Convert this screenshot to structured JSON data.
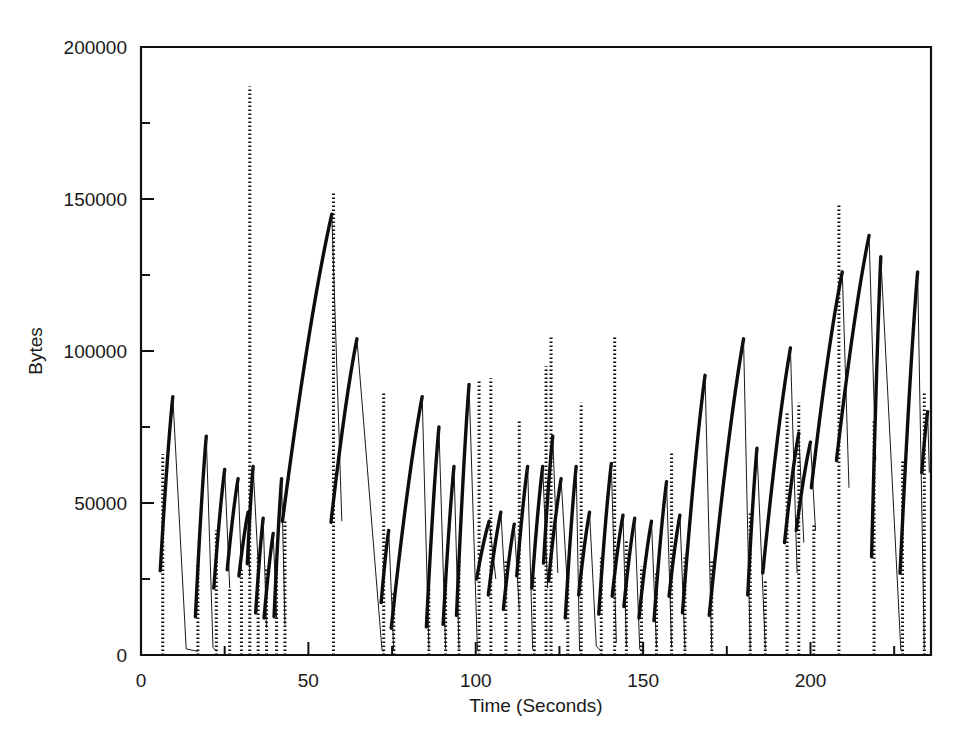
{
  "chart_data": {
    "type": "line",
    "title": "",
    "xlabel": "Time (Seconds)",
    "ylabel": "Bytes",
    "xlim": [
      0,
      236
    ],
    "ylim": [
      0,
      200000
    ],
    "grid": false,
    "legend": null,
    "xticks": [
      0,
      50,
      100,
      150,
      200
    ],
    "xtick_labels": [
      "0",
      "50",
      "100",
      "150",
      "200"
    ],
    "xticks_minor": [
      25,
      75,
      125,
      175,
      225
    ],
    "yticks": [
      0,
      50000,
      100000,
      150000,
      200000
    ],
    "ytick_labels": [
      "0",
      "50000",
      "100000",
      "150000",
      "200000"
    ],
    "yticks_minor": [
      25000,
      75000,
      125000,
      175000
    ],
    "series": [
      {
        "name": "Bytes in flight",
        "style": "sawtooth",
        "comment": "Each cycle: a dotted near-vertical rise from ~0 to a knee value, a solid sloped ramp up to a peak, then a steep thin drop back toward 0.",
        "cycles": [
          {
            "t_rise": 6.5,
            "y_knee": 66000,
            "t_peak": 9.5,
            "y_peak": 85000,
            "t_drop_end": 13.5,
            "y_drop": 2000
          },
          {
            "t_rise": 17.0,
            "y_knee": 30000,
            "t_peak": 19.5,
            "y_peak": 72000,
            "t_drop_end": 21.5,
            "y_drop": 2500
          },
          {
            "t_rise": 22.5,
            "y_knee": 41000,
            "t_peak": 25.0,
            "y_peak": 61000,
            "t_drop_end": 26.5,
            "y_drop": 22000
          },
          {
            "t_rise": 26.5,
            "y_knee": 22000,
            "t_peak": 29.0,
            "y_peak": 58000,
            "t_drop_end": 30.0,
            "y_drop": 28000
          },
          {
            "t_rise": 30.0,
            "y_knee": 28000,
            "t_peak": 32.0,
            "y_peak": 47000,
            "t_drop_end": 32.5,
            "y_drop": 26000
          },
          {
            "t_rise": 32.5,
            "y_knee": 187000,
            "t_peak": 33.5,
            "y_peak": 62000,
            "t_drop_end": 35.0,
            "y_drop": 30000
          },
          {
            "t_rise": 35.0,
            "y_knee": 33000,
            "t_peak": 36.5,
            "y_peak": 45000,
            "t_drop_end": 37.5,
            "y_drop": 9000
          },
          {
            "t_rise": 37.5,
            "y_knee": 29000,
            "t_peak": 39.5,
            "y_peak": 40000,
            "t_drop_end": 40.5,
            "y_drop": 12000
          },
          {
            "t_rise": 40.5,
            "y_knee": 30000,
            "t_peak": 42.0,
            "y_peak": 58000,
            "t_drop_end": 43.0,
            "y_drop": 10000
          },
          {
            "t_rise": 43.0,
            "y_knee": 44000,
            "t_peak": 57.0,
            "y_peak": 145000,
            "t_drop_end": 60.0,
            "y_drop": 44000
          },
          {
            "t_rise": 57.5,
            "y_knee": 152000,
            "t_peak": 64.5,
            "y_peak": 104000,
            "t_drop_end": 72.0,
            "y_drop": 1500
          },
          {
            "t_rise": 72.5,
            "y_knee": 86000,
            "t_peak": 74.0,
            "y_peak": 41000,
            "t_drop_end": 75.5,
            "y_drop": 1500
          },
          {
            "t_rise": 75.5,
            "y_knee": 21000,
            "t_peak": 84.0,
            "y_peak": 85000,
            "t_drop_end": 86.0,
            "y_drop": 2000
          },
          {
            "t_rise": 86.0,
            "y_knee": 22000,
            "t_peak": 89.0,
            "y_peak": 75000,
            "t_drop_end": 91.0,
            "y_drop": 2000
          },
          {
            "t_rise": 91.0,
            "y_knee": 24000,
            "t_peak": 93.5,
            "y_peak": 62000,
            "t_drop_end": 95.0,
            "y_drop": 2000
          },
          {
            "t_rise": 95.0,
            "y_knee": 31000,
            "t_peak": 98.0,
            "y_peak": 89000,
            "t_drop_end": 100.5,
            "y_drop": 1500
          },
          {
            "t_rise": 101.0,
            "y_knee": 90000,
            "t_peak": 104.0,
            "y_peak": 44000,
            "t_drop_end": 106.0,
            "y_drop": 25000
          },
          {
            "t_rise": 104.5,
            "y_knee": 91000,
            "t_peak": 107.5,
            "y_peak": 47000,
            "t_drop_end": 109.0,
            "y_drop": 18000
          },
          {
            "t_rise": 109.0,
            "y_knee": 31000,
            "t_peak": 111.5,
            "y_peak": 43000,
            "t_drop_end": 113.0,
            "y_drop": 15000
          },
          {
            "t_rise": 113.0,
            "y_knee": 77000,
            "t_peak": 115.5,
            "y_peak": 62000,
            "t_drop_end": 117.0,
            "y_drop": 2000
          },
          {
            "t_rise": 117.5,
            "y_knee": 26000,
            "t_peak": 120.0,
            "y_peak": 62000,
            "t_drop_end": 121.5,
            "y_drop": 22000
          },
          {
            "t_rise": 121.0,
            "y_knee": 95000,
            "t_peak": 123.0,
            "y_peak": 72000,
            "t_drop_end": 124.5,
            "y_drop": 27000
          },
          {
            "t_rise": 122.5,
            "y_knee": 105000,
            "t_peak": 125.5,
            "y_peak": 58000,
            "t_drop_end": 127.5,
            "y_drop": 20000
          },
          {
            "t_rise": 127.5,
            "y_knee": 29000,
            "t_peak": 130.0,
            "y_peak": 62000,
            "t_drop_end": 131.0,
            "y_drop": 1500
          },
          {
            "t_rise": 131.5,
            "y_knee": 83000,
            "t_peak": 134.0,
            "y_peak": 47000,
            "t_drop_end": 136.0,
            "y_drop": 3000
          },
          {
            "t_rise": 137.5,
            "y_knee": 32000,
            "t_peak": 140.5,
            "y_peak": 63000,
            "t_drop_end": 142.0,
            "y_drop": 4000
          },
          {
            "t_rise": 141.5,
            "y_knee": 105000,
            "t_peak": 144.0,
            "y_peak": 46000,
            "t_drop_end": 145.0,
            "y_drop": 3000
          },
          {
            "t_rise": 145.0,
            "y_knee": 38000,
            "t_peak": 147.5,
            "y_peak": 45000,
            "t_drop_end": 149.0,
            "y_drop": 2000
          },
          {
            "t_rise": 149.5,
            "y_knee": 29000,
            "t_peak": 152.5,
            "y_peak": 44000,
            "t_drop_end": 154.0,
            "y_drop": 2500
          },
          {
            "t_rise": 154.0,
            "y_knee": 27000,
            "t_peak": 157.0,
            "y_peak": 57000,
            "t_drop_end": 158.5,
            "y_drop": 2500
          },
          {
            "t_rise": 158.5,
            "y_knee": 67000,
            "t_peak": 161.0,
            "y_peak": 46000,
            "t_drop_end": 162.5,
            "y_drop": 2000
          },
          {
            "t_rise": 162.5,
            "y_knee": 33000,
            "t_peak": 168.5,
            "y_peak": 92000,
            "t_drop_end": 170.5,
            "y_drop": 2000
          },
          {
            "t_rise": 170.5,
            "y_knee": 31000,
            "t_peak": 180.0,
            "y_peak": 104000,
            "t_drop_end": 182.0,
            "y_drop": 2000
          },
          {
            "t_rise": 182.0,
            "y_knee": 47000,
            "t_peak": 184.0,
            "y_peak": 68000,
            "t_drop_end": 186.5,
            "y_drop": 2000
          },
          {
            "t_rise": 186.5,
            "y_knee": 25000,
            "t_peak": 194.0,
            "y_peak": 101000,
            "t_drop_end": 196.0,
            "y_drop": 27000
          },
          {
            "t_rise": 193.0,
            "y_knee": 80000,
            "t_peak": 196.5,
            "y_peak": 73000,
            "t_drop_end": 198.0,
            "y_drop": 37000
          },
          {
            "t_rise": 196.5,
            "y_knee": 83000,
            "t_peak": 200.0,
            "y_peak": 70000,
            "t_drop_end": 201.5,
            "y_drop": 41000
          },
          {
            "t_rise": 201.0,
            "y_knee": 43000,
            "t_peak": 209.5,
            "y_peak": 126000,
            "t_drop_end": 211.5,
            "y_drop": 55000
          },
          {
            "t_rise": 208.5,
            "y_knee": 148000,
            "t_peak": 217.5,
            "y_peak": 138000,
            "t_drop_end": 219.5,
            "y_drop": 64000
          },
          {
            "t_rise": 219.0,
            "y_knee": 77000,
            "t_peak": 221.0,
            "y_peak": 131000,
            "t_drop_end": 227.0,
            "y_drop": 1500
          },
          {
            "t_rise": 227.5,
            "y_knee": 64000,
            "t_peak": 232.0,
            "y_peak": 126000,
            "t_drop_end": 234.0,
            "y_drop": 2000
          },
          {
            "t_rise": 234.0,
            "y_knee": 86000,
            "t_peak": 235.0,
            "y_peak": 80000,
            "t_drop_end": 235.5,
            "y_drop": 60000
          }
        ]
      }
    ]
  },
  "axes": {
    "y_axis_label": "Bytes",
    "x_axis_label": "Time (Seconds)"
  },
  "colors": {
    "line": "#0d0d0d",
    "axis": "#111111",
    "background": "#ffffff",
    "text": "#1a1a1a"
  }
}
